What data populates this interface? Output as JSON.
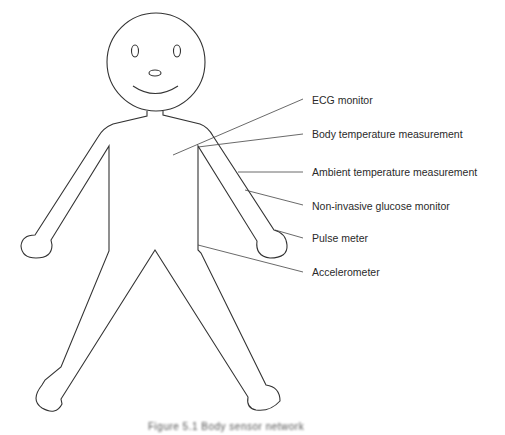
{
  "figure": {
    "type": "human body sensor placement diagram",
    "caption": "Figure 5.1 Body sensor network"
  },
  "labels": [
    {
      "text": "ECG monitor",
      "y": 94
    },
    {
      "text": "Body temperature measurement",
      "y": 128
    },
    {
      "text": "Ambient temperature measurement",
      "y": 166
    },
    {
      "text": "Non-invasive glucose monitor",
      "y": 200
    },
    {
      "text": "Pulse meter",
      "y": 232
    },
    {
      "text": "Accelerometer",
      "y": 266
    }
  ],
  "colors": {
    "stroke": "#333333",
    "text": "#2a2a2a",
    "background": "#ffffff"
  }
}
